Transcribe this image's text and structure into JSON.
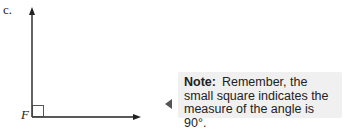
{
  "exercise": {
    "part_label": "c.",
    "vertex_label": "F",
    "figure": {
      "type": "right-angle",
      "vertex": "F",
      "angle_degrees": 90,
      "rays": [
        "up",
        "right"
      ],
      "right_angle_marker": "small square",
      "stroke_color": "#222222"
    }
  },
  "note": {
    "label": "Note:",
    "text": "Remember, the small square indicates the measure of the angle is 90°.",
    "background": "#f0f0f0",
    "pointer": "left-triangle-icon"
  }
}
